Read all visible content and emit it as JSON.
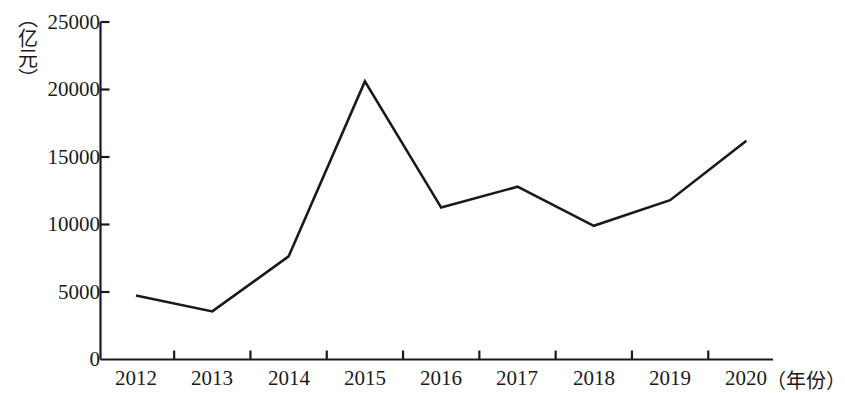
{
  "chart_data": {
    "type": "line",
    "title": "",
    "xlabel": "（年份）",
    "ylabel": "（亿元）",
    "categories": [
      "2012",
      "2013",
      "2014",
      "2015",
      "2016",
      "2017",
      "2018",
      "2019",
      "2020"
    ],
    "values": [
      4750,
      3560,
      7640,
      20600,
      11250,
      12800,
      9900,
      11800,
      16200
    ],
    "series": [
      {
        "name": "",
        "values": [
          4750,
          3560,
          7640,
          20600,
          11250,
          12800,
          9900,
          11800,
          16200
        ]
      }
    ],
    "ylim": [
      0,
      25000
    ],
    "ytick_values": [
      0,
      5000,
      10000,
      15000,
      20000,
      25000
    ],
    "ytick_labels": [
      "0",
      "5000",
      "10000",
      "15000",
      "20000",
      "25000"
    ],
    "xtick_labels": [
      "2012",
      "2013",
      "2014",
      "2015",
      "2016",
      "2017",
      "2018",
      "2019",
      "2020"
    ],
    "grid": false,
    "legend": null,
    "line_color": "#1a1a1a",
    "axis_color": "#1a1a1a",
    "background_color": "#ffffff"
  }
}
